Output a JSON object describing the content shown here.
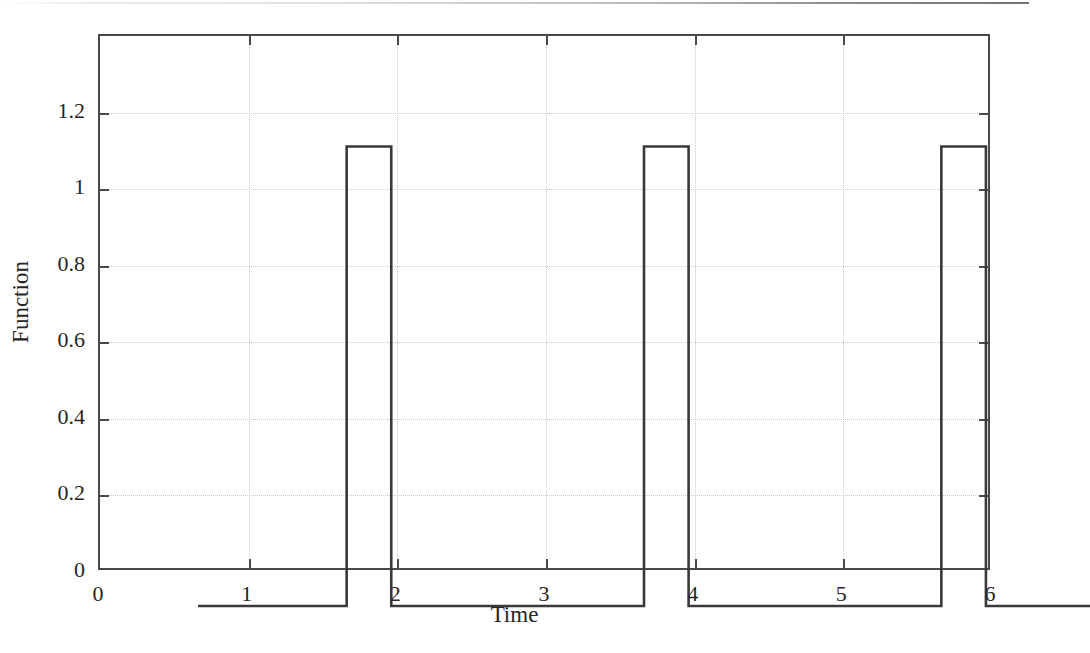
{
  "figure": {
    "background_color": "#ffffff",
    "axis_color": "#4a4a4a",
    "grid_color": "#c9c9c9",
    "line_color": "#3a3a3a",
    "has_scan_edge_artifact": true
  },
  "axes": {
    "xlabel": "Time",
    "ylabel": "Function",
    "xticklabels": [
      "0",
      "1",
      "2",
      "3",
      "4",
      "5",
      "6"
    ],
    "yticklabels": [
      "0",
      "0.2",
      "0.4",
      "0.6",
      "0.8",
      "1",
      "1.2"
    ]
  },
  "chart_data": {
    "type": "line",
    "title": "",
    "subtitle": "",
    "xlabel": "Time",
    "ylabel": "Function",
    "xlim": [
      0,
      6
    ],
    "ylim": [
      0,
      1.4
    ],
    "xticks": [
      0,
      1,
      2,
      3,
      4,
      5,
      6
    ],
    "yticks": [
      0,
      0.2,
      0.4,
      0.6,
      0.8,
      1,
      1.2
    ],
    "grid": true,
    "grid_style": "dotted",
    "legend": null,
    "legend_position": "none",
    "annotations": [],
    "series": [
      {
        "name": "Function",
        "drawstyle": "steps-post",
        "color": "#3a3a3a",
        "linewidth": 2,
        "amplitude": 1.2,
        "baseline": 0,
        "pulse_width": 0.3,
        "period": 2,
        "pulse_starts": [
          1,
          3,
          5
        ],
        "pulse_ends": [
          1.3,
          3.3,
          5.3
        ],
        "x": [
          0,
          1,
          1,
          1.3,
          1.3,
          3,
          3,
          3.3,
          3.3,
          5,
          5,
          5.3,
          5.3,
          6
        ],
        "y": [
          0,
          0,
          1.2,
          1.2,
          0,
          0,
          1.2,
          1.2,
          0,
          0,
          1.2,
          1.2,
          0,
          0
        ]
      }
    ]
  }
}
